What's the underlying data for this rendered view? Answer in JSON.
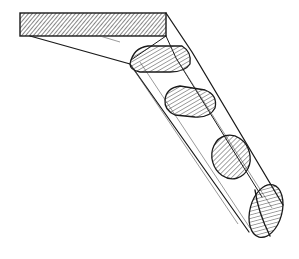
{
  "figure": {
    "colors": {
      "ink": "#1a1a1a",
      "background": "#ffffff"
    },
    "parts": {
      "top_slab": {
        "label": ""
      },
      "cross_sections": [
        {
          "name": "section-1",
          "cx": 158,
          "cy": 58
        },
        {
          "name": "section-2",
          "cx": 190,
          "cy": 103
        },
        {
          "name": "section-3",
          "cx": 230,
          "cy": 157
        },
        {
          "name": "section-4",
          "cx": 265,
          "cy": 211
        }
      ]
    }
  }
}
